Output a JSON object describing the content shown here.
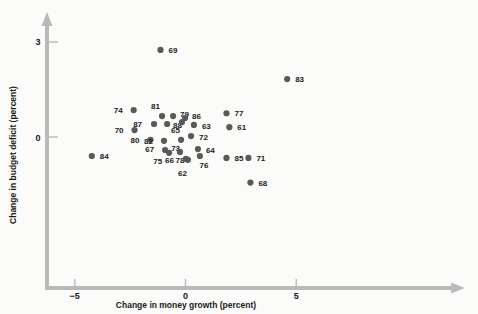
{
  "chart_data": {
    "type": "scatter",
    "title": "",
    "xlabel": "Change in money growth (percent)",
    "ylabel": "Change in budget deficit (percent)",
    "xlim": [
      -6.2,
      8.5
    ],
    "ylim": [
      -2.6,
      3.4
    ],
    "xticks": [
      -5,
      0,
      5
    ],
    "xtick_labels": [
      "−5",
      "0",
      "5"
    ],
    "yticks": [
      0,
      3
    ],
    "ytick_labels": [
      "0",
      "3"
    ],
    "grid": false,
    "legend": "none",
    "marker_color": "#595959",
    "axis_color": "#b9b9b9",
    "point_label_field": "year",
    "points": [
      {
        "label": "69",
        "x": -1.13,
        "y": 2.75,
        "lx": 8,
        "ly": 3
      },
      {
        "label": "83",
        "x": 4.59,
        "y": 1.83,
        "lx": 8,
        "ly": 3
      },
      {
        "label": "74",
        "x": -2.34,
        "y": 0.85,
        "lx": -11,
        "ly": 3
      },
      {
        "label": "70",
        "x": -2.3,
        "y": 0.22,
        "lx": -11,
        "ly": 3
      },
      {
        "label": "81",
        "x": -1.06,
        "y": 0.66,
        "lx": -2,
        "ly": -7
      },
      {
        "label": "87",
        "x": -1.42,
        "y": 0.41,
        "lx": -12,
        "ly": 3
      },
      {
        "label": "88",
        "x": -0.83,
        "y": 0.41,
        "lx": 6,
        "ly": 4
      },
      {
        "label": "79",
        "x": -0.56,
        "y": 0.66,
        "lx": 7,
        "ly": 1
      },
      {
        "label": "86",
        "x": -0.02,
        "y": 0.6,
        "lx": 7,
        "ly": 1
      },
      {
        "label": "65",
        "x": -0.16,
        "y": 0.47,
        "lx": -2,
        "ly": 11
      },
      {
        "label": "63",
        "x": 0.38,
        "y": 0.38,
        "lx": 8,
        "ly": 4
      },
      {
        "label": "77",
        "x": 1.85,
        "y": 0.75,
        "lx": 8,
        "ly": 3
      },
      {
        "label": "61",
        "x": 1.98,
        "y": 0.31,
        "lx": 8,
        "ly": 3
      },
      {
        "label": "72",
        "x": 0.25,
        "y": 0.03,
        "lx": 8,
        "ly": 4
      },
      {
        "label": "80",
        "x": -1.58,
        "y": -0.09,
        "lx": -11,
        "ly": 3
      },
      {
        "label": "82",
        "x": -0.97,
        "y": -0.12,
        "lx": -11,
        "ly": 3
      },
      {
        "label": "73",
        "x": -0.2,
        "y": -0.09,
        "lx": -1,
        "ly": 11
      },
      {
        "label": "67",
        "x": -0.92,
        "y": -0.41,
        "lx": -11,
        "ly": 2
      },
      {
        "label": "75",
        "x": -0.74,
        "y": -0.5,
        "lx": -7,
        "ly": 11
      },
      {
        "label": "78",
        "x": -0.25,
        "y": -0.47,
        "lx": 0,
        "ly": 11
      },
      {
        "label": "64",
        "x": 0.56,
        "y": -0.38,
        "lx": 8,
        "ly": 4
      },
      {
        "label": "76",
        "x": 0.65,
        "y": -0.6,
        "lx": 4,
        "ly": 12
      },
      {
        "label": "66",
        "x": 0.02,
        "y": -0.69,
        "lx": -12,
        "ly": 4
      },
      {
        "label": "62",
        "x": 0.11,
        "y": -0.72,
        "lx": -1,
        "ly": 16
      },
      {
        "label": "84",
        "x": -4.23,
        "y": -0.6,
        "lx": 8,
        "ly": 3
      },
      {
        "label": "85",
        "x": 1.85,
        "y": -0.66,
        "lx": 8,
        "ly": 3
      },
      {
        "label": "71",
        "x": 2.84,
        "y": -0.66,
        "lx": 8,
        "ly": 3
      },
      {
        "label": "68",
        "x": 2.93,
        "y": -1.44,
        "lx": 8,
        "ly": 3
      }
    ]
  }
}
